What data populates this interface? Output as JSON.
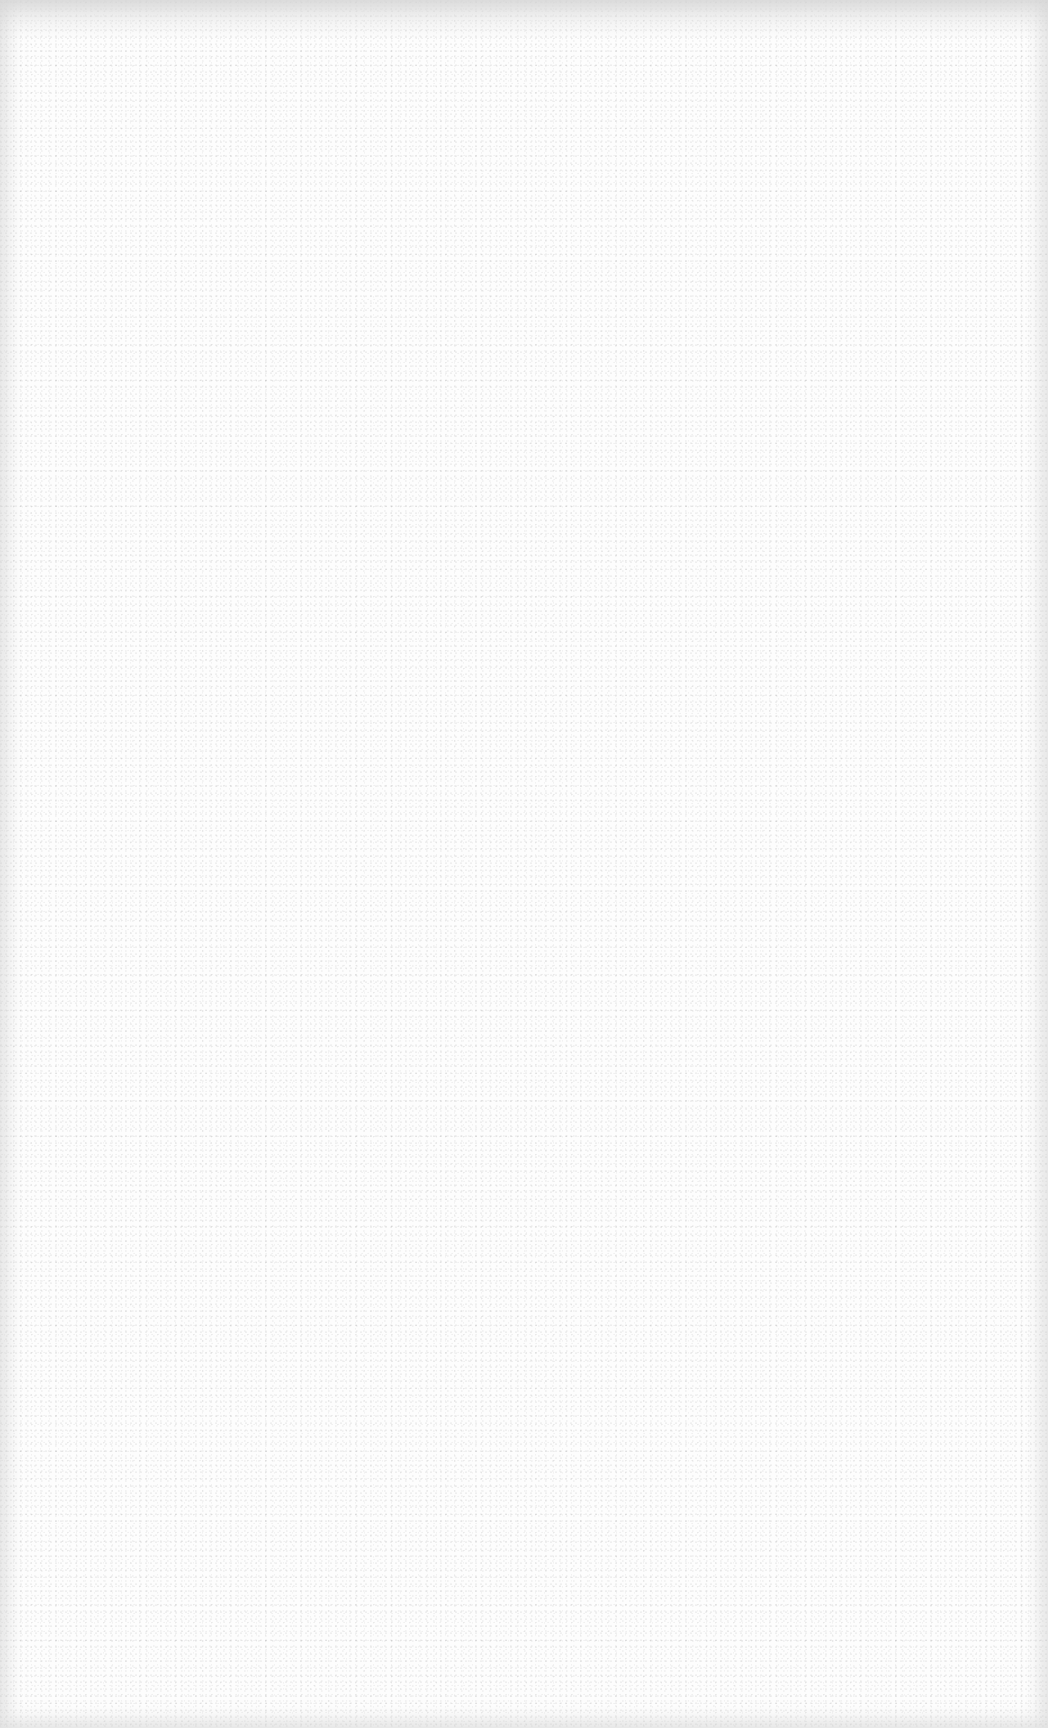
{
  "surface": {
    "description": "Blank white page with fine grain noise and a light grey edge vignette; no visible text or UI elements",
    "background_color": "#fdfdfd",
    "edge_color": "#e0e0e0"
  }
}
